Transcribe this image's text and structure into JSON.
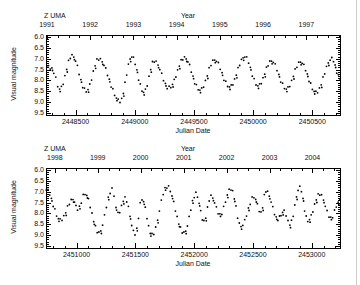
{
  "page": {
    "background": "#ffffff",
    "edge_line_color": "#cccccc"
  },
  "jitter_mag": [
    0.02,
    -0.06,
    0.05,
    -0.03,
    0.08,
    -0.08,
    0.03,
    0.0,
    -0.05,
    0.07,
    -0.02,
    0.04,
    -0.07,
    0.06,
    -0.04,
    0.01
  ],
  "chart_data": [
    {
      "type": "scatter",
      "title": "Z UMA",
      "top_axis_label": "Year",
      "xlabel": "Julian Date",
      "ylabel": "Visual magnitude",
      "xlim": [
        2448250,
        2450734
      ],
      "ylim": [
        5.9,
        9.6
      ],
      "y_axis_inverted_magnitude": true,
      "grid": false,
      "xticks": [
        2448500,
        2449000,
        2449500,
        2450000,
        2450500
      ],
      "xtick_labels": [
        "2448500",
        "2449000",
        "2449500",
        "2450000",
        "2450500"
      ],
      "x_minor_step": 100,
      "yticks": [
        6.0,
        6.5,
        7.0,
        7.5,
        8.0,
        8.5,
        9.0,
        9.5
      ],
      "ytick_labels": [
        "6.0",
        "6.5",
        "7.0",
        "7.5",
        "8.0",
        "8.5",
        "9.0",
        "9.5"
      ],
      "y_minor_step": 0.1,
      "year_ticks": [
        {
          "label": "1991",
          "jd": 2448258
        },
        {
          "label": "1992",
          "jd": 2448623
        },
        {
          "label": "1993",
          "jd": 2448989
        },
        {
          "label": "1994",
          "jd": 2449354
        },
        {
          "label": "1995",
          "jd": 2449719
        },
        {
          "label": "1996",
          "jd": 2450084
        },
        {
          "label": "1997",
          "jd": 2450450
        }
      ],
      "year_minor_step_days": 91.31,
      "point_color": "#000000",
      "point_radius": 0.9,
      "sample_step_days": 15,
      "twin_every": 4,
      "twin_dt_days": 5,
      "twin_dmag": 0.12,
      "series_keypoints_jd_mag": [
        [
          2448257,
          7.35
        ],
        [
          2448300,
          7.45
        ],
        [
          2448365,
          8.4
        ],
        [
          2448470,
          6.85
        ],
        [
          2448590,
          8.5
        ],
        [
          2448695,
          7.0
        ],
        [
          2448875,
          8.95
        ],
        [
          2448975,
          6.9
        ],
        [
          2449075,
          8.55
        ],
        [
          2449165,
          7.1
        ],
        [
          2449290,
          8.35
        ],
        [
          2449420,
          6.95
        ],
        [
          2449550,
          8.45
        ],
        [
          2449675,
          7.05
        ],
        [
          2449800,
          8.3
        ],
        [
          2449930,
          6.9
        ],
        [
          2450040,
          8.25
        ],
        [
          2450155,
          7.1
        ],
        [
          2450280,
          8.4
        ],
        [
          2450400,
          7.15
        ],
        [
          2450530,
          8.55
        ],
        [
          2450665,
          7.0
        ],
        [
          2450734,
          7.9
        ]
      ]
    },
    {
      "type": "scatter",
      "title": "Z UMA",
      "top_axis_label": "Year",
      "xlabel": "Julian Date",
      "ylabel": "Visual magnitude",
      "xlim": [
        2450740,
        2453240
      ],
      "ylim": [
        5.9,
        9.6
      ],
      "y_axis_inverted_magnitude": true,
      "grid": false,
      "xticks": [
        2451000,
        2451500,
        2452000,
        2452500,
        2453000
      ],
      "xtick_labels": [
        "2451000",
        "2451500",
        "2452000",
        "2452500",
        "2453000"
      ],
      "x_minor_step": 100,
      "yticks": [
        6.0,
        6.5,
        7.0,
        7.5,
        8.0,
        8.5,
        9.0,
        9.5
      ],
      "ytick_labels": [
        "6.0",
        "6.5",
        "7.0",
        "7.5",
        "8.0",
        "8.5",
        "9.0",
        "9.5"
      ],
      "y_minor_step": 0.1,
      "year_ticks": [
        {
          "label": "1998",
          "jd": 2450815
        },
        {
          "label": "1999",
          "jd": 2451180
        },
        {
          "label": "2000",
          "jd": 2451545
        },
        {
          "label": "2001",
          "jd": 2451911
        },
        {
          "label": "2002",
          "jd": 2452276
        },
        {
          "label": "2003",
          "jd": 2452641
        },
        {
          "label": "2004",
          "jd": 2453006
        }
      ],
      "year_minor_step_days": 91.31,
      "point_color": "#000000",
      "point_radius": 0.9,
      "sample_step_days": 15,
      "twin_every": 4,
      "twin_dt_days": 5,
      "twin_dmag": 0.12,
      "series_keypoints_jd_mag": [
        [
          2450742,
          6.9
        ],
        [
          2450860,
          8.3
        ],
        [
          2450970,
          7.35
        ],
        [
          2451008,
          7.8
        ],
        [
          2451072,
          7.1
        ],
        [
          2451190,
          8.9
        ],
        [
          2451301,
          6.9
        ],
        [
          2451352,
          8.0
        ],
        [
          2451412,
          7.3
        ],
        [
          2451497,
          8.95
        ],
        [
          2451556,
          7.35
        ],
        [
          2451641,
          9.0
        ],
        [
          2451768,
          6.75
        ],
        [
          2451913,
          8.9
        ],
        [
          2452015,
          7.1
        ],
        [
          2452083,
          8.35
        ],
        [
          2452143,
          7.2
        ],
        [
          2452219,
          8.05
        ],
        [
          2452313,
          6.85
        ],
        [
          2452398,
          8.6
        ],
        [
          2452508,
          7.25
        ],
        [
          2452568,
          7.95
        ],
        [
          2452610,
          6.95
        ],
        [
          2452712,
          8.25
        ],
        [
          2452765,
          7.9
        ],
        [
          2452814,
          8.5
        ],
        [
          2452898,
          6.8
        ],
        [
          2452966,
          8.35
        ],
        [
          2453068,
          7.1
        ],
        [
          2453162,
          8.2
        ],
        [
          2453240,
          7.4
        ]
      ]
    }
  ]
}
